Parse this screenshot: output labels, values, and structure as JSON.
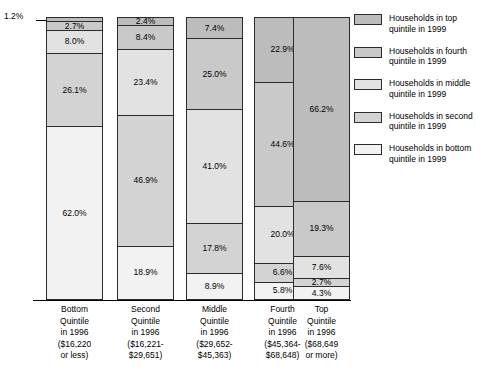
{
  "chart_data": {
    "type": "bar",
    "subtype": "100-percent-stacked-column",
    "title": "",
    "xlabel": "",
    "ylabel": "",
    "ylim": [
      0,
      100
    ],
    "grid": false,
    "legend_position": "right",
    "categories": [
      "Bottom Quintile in 1996 ($16,220 or less)",
      "Second Quintile in 1996 ($16,221-$29,651)",
      "Middle Quintile in 1996 ($29,652-$45,363)",
      "Fourth Quintile in 1996 ($45,364-$68,648)",
      "Top Quintile in 1996 ($68,649 or more)"
    ],
    "series": [
      {
        "name": "Households in top quintile in 1999",
        "values": [
          1.2,
          2.4,
          7.4,
          22.9,
          66.2
        ]
      },
      {
        "name": "Households in fourth quintile in 1999",
        "values": [
          2.7,
          8.4,
          25.0,
          44.6,
          19.3
        ]
      },
      {
        "name": "Households in middle quintile in 1999",
        "values": [
          8.0,
          23.4,
          41.0,
          20.0,
          7.6
        ]
      },
      {
        "name": "Households in second quintile in 1999",
        "values": [
          26.1,
          46.9,
          17.8,
          6.6,
          2.7
        ]
      },
      {
        "name": "Households in bottom quintile in 1999",
        "values": [
          62.0,
          18.9,
          8.9,
          5.8,
          4.3
        ]
      }
    ],
    "annotations": [
      {
        "text": "1.2%",
        "target_bar": 0,
        "target_series": 0
      }
    ]
  },
  "bars": [
    {
      "id": "bar-bottom-quintile",
      "segments": [
        {
          "label": "",
          "value": 1.2,
          "fill": "q0"
        },
        {
          "label": "2.7%",
          "value": 2.7,
          "fill": "q1"
        },
        {
          "label": "8.0%",
          "value": 8.0,
          "fill": "q2"
        },
        {
          "label": "26.1%",
          "value": 26.1,
          "fill": "q3"
        },
        {
          "label": "62.0%",
          "value": 62.0,
          "fill": "q4"
        }
      ]
    },
    {
      "id": "bar-second-quintile",
      "segments": [
        {
          "label": "2.4%",
          "value": 2.4,
          "fill": "q0"
        },
        {
          "label": "8.4%",
          "value": 8.4,
          "fill": "q1"
        },
        {
          "label": "23.4%",
          "value": 23.4,
          "fill": "q2"
        },
        {
          "label": "46.9%",
          "value": 46.9,
          "fill": "q3"
        },
        {
          "label": "18.9%",
          "value": 18.9,
          "fill": "q4"
        }
      ]
    },
    {
      "id": "bar-middle-quintile",
      "segments": [
        {
          "label": "7.4%",
          "value": 7.4,
          "fill": "q0"
        },
        {
          "label": "25.0%",
          "value": 25.0,
          "fill": "q1"
        },
        {
          "label": "41.0%",
          "value": 41.0,
          "fill": "q2"
        },
        {
          "label": "17.8%",
          "value": 17.8,
          "fill": "q3"
        },
        {
          "label": "8.9%",
          "value": 8.9,
          "fill": "q4"
        }
      ]
    },
    {
      "id": "bar-fourth-quintile",
      "segments": [
        {
          "label": "22.9%",
          "value": 22.9,
          "fill": "q0"
        },
        {
          "label": "44.6%",
          "value": 44.6,
          "fill": "q1"
        },
        {
          "label": "20.0%",
          "value": 20.0,
          "fill": "q2"
        },
        {
          "label": "6.6%",
          "value": 6.6,
          "fill": "q3"
        },
        {
          "label": "5.8%",
          "value": 5.8,
          "fill": "q4"
        }
      ]
    },
    {
      "id": "bar-top-quintile",
      "segments": [
        {
          "label": "66.2%",
          "value": 66.2,
          "fill": "q0"
        },
        {
          "label": "19.3%",
          "value": 19.3,
          "fill": "q1"
        },
        {
          "label": "7.6%",
          "value": 7.6,
          "fill": "q2"
        },
        {
          "label": "2.7%",
          "value": 2.7,
          "fill": "q3"
        },
        {
          "label": "4.3%",
          "value": 4.3,
          "fill": "q4"
        }
      ]
    }
  ],
  "callout": {
    "text": "1.2%"
  },
  "xaxis": {
    "labels": [
      [
        "Bottom",
        "Quintile",
        "in 1996",
        "($16,220",
        "or less)"
      ],
      [
        "Second",
        "Quintile",
        "in 1996",
        "($16,221-",
        "$29,651)"
      ],
      [
        "Middle",
        "Quintile",
        "in 1996",
        "($29,652-",
        "$45,363)"
      ],
      [
        "Fourth",
        "Quintile",
        "in 1996",
        "($45,364-",
        "$68,648)"
      ],
      [
        "Top",
        "Quintile",
        "in 1996",
        "($68,649",
        "or more)"
      ]
    ]
  },
  "legend": {
    "items": [
      {
        "line1": "Households in top",
        "line2": "quintile in 1999",
        "fill": "q0"
      },
      {
        "line1": "Households in fourth",
        "line2": "quintile in 1999",
        "fill": "q1"
      },
      {
        "line1": "Households in middle",
        "line2": "quintile in 1999",
        "fill": "q2"
      },
      {
        "line1": "Households in second",
        "line2": "quintile in 1999",
        "fill": "q3"
      },
      {
        "line1": "Households in bottom",
        "line2": "quintile in 1999",
        "fill": "q4"
      }
    ]
  },
  "colors": {
    "q0": "#bcbcbc",
    "q1": "#c9c9c9",
    "q2": "#e2e2e2",
    "q3": "#d3d3d3",
    "q4": "#f2f2f2",
    "outline": "#2b2b2b",
    "text": "#000000",
    "background": "#ffffff"
  }
}
